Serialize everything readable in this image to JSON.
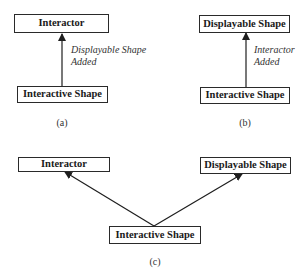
{
  "panels": {
    "a": {
      "caption": "(a)",
      "top_box": "Interactor",
      "bottom_box": "Interactive Shape",
      "arrow_label_line1": "Displayable Shape",
      "arrow_label_line2": "Added"
    },
    "b": {
      "caption": "(b)",
      "top_box": "Displayable Shape",
      "bottom_box": "Interactive Shape",
      "arrow_label_line1": "Interactor",
      "arrow_label_line2": "Added"
    },
    "c": {
      "caption": "(c)",
      "left_box": "Interactor",
      "right_box": "Displayable Shape",
      "bottom_box": "Interactive Shape"
    }
  },
  "colors": {
    "line": "#1e1e1e",
    "background": "#ffffff"
  }
}
